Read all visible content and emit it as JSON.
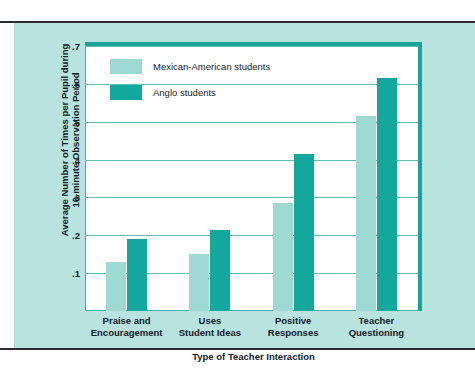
{
  "chart_data": {
    "type": "bar",
    "title": "",
    "xlabel": "Type of Teacher Interaction",
    "ylabel": "Average Number of Times per Pupil during 10-minute Observation Period",
    "ylabel_lines": [
      "Average Number of Times per Pupil during",
      "10-minute Observation Period"
    ],
    "categories": [
      "Praise and Encouragement",
      "Uses Student Ideas",
      "Positive Responses",
      "Teacher Questioning"
    ],
    "category_lines": [
      [
        "Praise and",
        "Encouragement"
      ],
      [
        "Uses",
        "Student Ideas"
      ],
      [
        "Positive",
        "Responses"
      ],
      [
        "Teacher",
        "Questioning"
      ]
    ],
    "series": [
      {
        "name": "Mexican-American students",
        "color": "#9ed9d3",
        "values": [
          0.13,
          0.15,
          0.285,
          0.515
        ]
      },
      {
        "name": "Anglo students",
        "color": "#14a79d",
        "values": [
          0.19,
          0.215,
          0.415,
          0.615
        ]
      }
    ],
    "ylim": [
      0,
      0.7
    ],
    "yticks": [
      0.1,
      0.2,
      0.3,
      0.4,
      0.5,
      0.6,
      0.7
    ],
    "ytick_labels": [
      ".1",
      ".2",
      ".3",
      ".4",
      ".5",
      ".6",
      ".7"
    ],
    "grid": true,
    "legend_position": "upper left"
  },
  "legend": {
    "items": [
      {
        "label": "Mexican-American students"
      },
      {
        "label": "Anglo students"
      }
    ]
  },
  "colors": {
    "panel_background": "#b8e3de",
    "plot_background": "#ffffff",
    "frame": "#19a29a",
    "gridline": "#62bfb8",
    "rule": "#2b2b33",
    "series_light": "#9ed9d3",
    "series_dark": "#14a79d",
    "text": "#15202b"
  }
}
